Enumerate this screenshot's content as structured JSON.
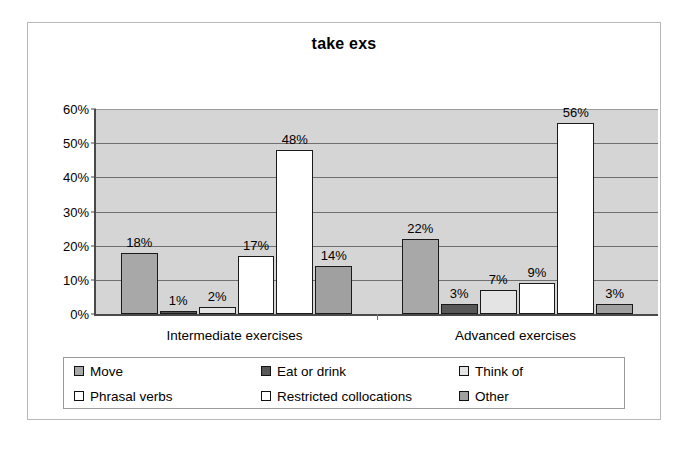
{
  "chart_data": {
    "type": "bar",
    "title": "take exs",
    "xlabel": "",
    "ylabel": "",
    "ylim": [
      0,
      60
    ],
    "ytick_step": 10,
    "ytick_labels": [
      "0%",
      "10%",
      "20%",
      "30%",
      "40%",
      "50%",
      "60%"
    ],
    "grid": true,
    "legend_position": "bottom",
    "value_suffix": "%",
    "categories": [
      "Intermediate exercises",
      "Advanced exercises"
    ],
    "series": [
      {
        "name": "Move",
        "values": [
          18,
          22
        ],
        "labels": [
          "18%",
          "22%"
        ],
        "color": "#a8a8a8"
      },
      {
        "name": "Eat or drink",
        "values": [
          1,
          3
        ],
        "labels": [
          "1%",
          "3%"
        ],
        "color": "#585858"
      },
      {
        "name": "Think of",
        "values": [
          2,
          7
        ],
        "labels": [
          "2%",
          "7%"
        ],
        "color": "#e4e4e4"
      },
      {
        "name": "Phrasal verbs",
        "values": [
          17,
          9
        ],
        "labels": [
          "17%",
          "9%"
        ],
        "color": "#ffffff"
      },
      {
        "name": "Restricted collocations",
        "values": [
          48,
          56
        ],
        "labels": [
          "48%",
          "56%"
        ],
        "color": "#ffffff"
      },
      {
        "name": "Other",
        "values": [
          14,
          3
        ],
        "labels": [
          "14%",
          "3%"
        ],
        "color": "#a0a0a0"
      }
    ]
  },
  "colors": {
    "plot_background": "#d5d5d5",
    "frame_border": "#b8b8b8",
    "axis": "#4a4a4a",
    "gridline": "#6f6f6f",
    "bar_outline": "#1a1a1a",
    "text": "#000000"
  }
}
